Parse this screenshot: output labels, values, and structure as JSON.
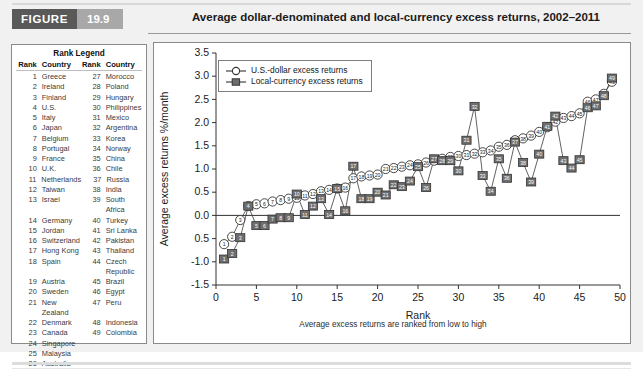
{
  "figure": {
    "badge_word": "FIGURE",
    "badge_number": "19.9",
    "title": "Average dollar-denominated and local-currency excess returns, 2002–2011"
  },
  "rank_legend": {
    "title": "Rank Legend",
    "headers": {
      "rank": "Rank",
      "country": "Country",
      "rank2": "Rank",
      "country2": "Country"
    },
    "rows": [
      {
        "rank": "1",
        "country": "Greece",
        "rank2": "27",
        "country2": "Morocco"
      },
      {
        "rank": "2",
        "country": "Ireland",
        "rank2": "28",
        "country2": "Poland"
      },
      {
        "rank": "3",
        "country": "Finland",
        "rank2": "29",
        "country2": "Hungary"
      },
      {
        "rank": "4",
        "country": "U.S.",
        "rank2": "30",
        "country2": "Philippines"
      },
      {
        "rank": "5",
        "country": "Italy",
        "rank2": "31",
        "country2": "Mexico"
      },
      {
        "rank": "6",
        "country": "Japan",
        "rank2": "32",
        "country2": "Argentina"
      },
      {
        "rank": "7",
        "country": "Belgium",
        "rank2": "33",
        "country2": "Korea"
      },
      {
        "rank": "8",
        "country": "Portugal",
        "rank2": "34",
        "country2": "Norway"
      },
      {
        "rank": "9",
        "country": "France",
        "rank2": "35",
        "country2": "China"
      },
      {
        "rank": "10",
        "country": "U.K.",
        "rank2": "36",
        "country2": "Chile"
      },
      {
        "rank": "11",
        "country": "Netherlands",
        "rank2": "37",
        "country2": "Russia"
      },
      {
        "rank": "12",
        "country": "Taiwan",
        "rank2": "38",
        "country2": "India"
      },
      {
        "rank": "13",
        "country": "Israel",
        "rank2": "39",
        "country2": "South Africa"
      },
      {
        "rank": "14",
        "country": "Germany",
        "rank2": "40",
        "country2": "Turkey"
      },
      {
        "rank": "15",
        "country": "Jordan",
        "rank2": "41",
        "country2": "Sri Lanka"
      },
      {
        "rank": "16",
        "country": "Switzerland",
        "rank2": "42",
        "country2": "Pakistan"
      },
      {
        "rank": "17",
        "country": "Hong Kong",
        "rank2": "43",
        "country2": "Thailand"
      },
      {
        "rank": "18",
        "country": "Spain",
        "rank2": "44",
        "country2": "Czech Republic"
      },
      {
        "rank": "19",
        "country": "Austria",
        "rank2": "45",
        "country2": "Brazil"
      },
      {
        "rank": "20",
        "country": "Sweden",
        "rank2": "46",
        "country2": "Egypt"
      },
      {
        "rank": "21",
        "country": "New Zealand",
        "rank2": "47",
        "country2": "Peru"
      },
      {
        "rank": "22",
        "country": "Denmark",
        "rank2": "48",
        "country2": "Indonesia"
      },
      {
        "rank": "23",
        "country": "Canada",
        "rank2": "49",
        "country2": "Colombia"
      },
      {
        "rank": "24",
        "country": "Singapore",
        "rank2": "",
        "country2": ""
      },
      {
        "rank": "25",
        "country": "Malaysia",
        "rank2": "",
        "country2": ""
      },
      {
        "rank": "26",
        "country": "Australia",
        "rank2": "",
        "country2": ""
      }
    ]
  },
  "chart_data": {
    "type": "line",
    "title": "Average dollar-denominated and local-currency excess returns, 2002–2011",
    "xlabel": "Rank",
    "ylabel": "Average excess returns %/month",
    "footnote": "Average excess returns are ranked from low to high",
    "xlim": [
      0,
      50
    ],
    "ylim": [
      -1.5,
      3.5
    ],
    "xticks": [
      0,
      5,
      10,
      15,
      20,
      25,
      30,
      35,
      40,
      45,
      50
    ],
    "yticks": [
      -1.5,
      -1.0,
      -0.5,
      0.0,
      0.5,
      1.0,
      1.5,
      2.0,
      2.5,
      3.0,
      3.5
    ],
    "ytick_labels": [
      "-1.5",
      "-1.0",
      "0.5",
      "0.0",
      "0.5",
      "1.0",
      "1.5",
      "2.0",
      "2.5",
      "3.0",
      "3.5"
    ],
    "grid": false,
    "zero_line": true,
    "legend_position": "top-left",
    "marker_labels": true,
    "x": [
      1,
      2,
      3,
      4,
      5,
      6,
      7,
      8,
      9,
      10,
      11,
      12,
      13,
      14,
      15,
      16,
      17,
      18,
      19,
      20,
      21,
      22,
      23,
      24,
      25,
      26,
      27,
      28,
      29,
      30,
      31,
      32,
      33,
      34,
      35,
      36,
      37,
      38,
      39,
      40,
      41,
      42,
      43,
      44,
      45,
      46,
      47,
      48,
      49
    ],
    "series": [
      {
        "name": "U.S.-dollar excess returns",
        "marker": "circle-open",
        "color": "#ffffff",
        "edge_color": "#333333",
        "values": [
          -0.62,
          -0.46,
          -0.1,
          0.2,
          0.24,
          0.26,
          0.3,
          0.33,
          0.36,
          0.38,
          0.43,
          0.46,
          0.52,
          0.55,
          0.58,
          0.6,
          0.8,
          0.84,
          0.86,
          0.88,
          1.0,
          1.02,
          1.05,
          1.08,
          1.1,
          1.14,
          1.18,
          1.22,
          1.26,
          1.28,
          1.3,
          1.33,
          1.36,
          1.4,
          1.48,
          1.52,
          1.62,
          1.66,
          1.72,
          1.8,
          1.9,
          2.02,
          2.1,
          2.14,
          2.2,
          2.45,
          2.5,
          2.62,
          2.88
        ]
      },
      {
        "name": "Local-currency excess returns",
        "marker": "square-filled",
        "color": "#6e6e6e",
        "edge_color": "#333333",
        "values": [
          -0.94,
          -0.82,
          -0.48,
          0.2,
          -0.22,
          -0.22,
          -0.08,
          -0.05,
          -0.05,
          0.46,
          0.02,
          0.2,
          0.36,
          0.02,
          0.58,
          0.1,
          1.06,
          0.36,
          0.36,
          0.5,
          0.44,
          0.66,
          0.62,
          0.74,
          1.05,
          0.6,
          1.22,
          1.18,
          1.18,
          0.96,
          1.62,
          2.35,
          0.86,
          0.52,
          1.22,
          0.8,
          1.58,
          1.14,
          0.72,
          1.32,
          1.92,
          2.14,
          1.18,
          1.02,
          1.2,
          2.32,
          2.36,
          2.58,
          2.96
        ]
      }
    ]
  },
  "series_legend": [
    {
      "label": "U.S.-dollar excess returns",
      "icon": "open-circle-marker-icon"
    },
    {
      "label": "Local-currency excess returns",
      "icon": "filled-square-marker-icon"
    }
  ]
}
